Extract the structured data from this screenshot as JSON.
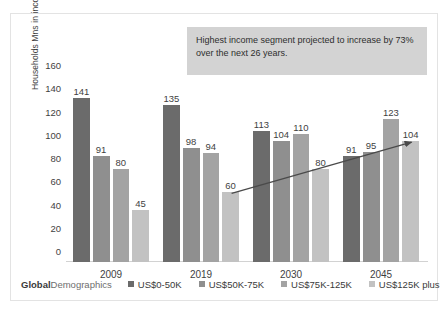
{
  "chart_data": {
    "type": "bar",
    "title": "",
    "xlabel": "",
    "ylabel": "Households Mns in income segment",
    "categories": [
      "2009",
      "2019",
      "2030",
      "2045"
    ],
    "ylim": [
      0,
      160
    ],
    "yticks": [
      0,
      20,
      40,
      60,
      80,
      100,
      120,
      140,
      160
    ],
    "grid": false,
    "legend_position": "bottom",
    "series": [
      {
        "name": "US$0-50K",
        "color": "#6b6b6b",
        "values": [
          141,
          135,
          113,
          91
        ]
      },
      {
        "name": "US$50K-75K",
        "color": "#8f8f8f",
        "values": [
          91,
          98,
          104,
          95
        ]
      },
      {
        "name": "US$75K-125K",
        "color": "#a3a3a3",
        "values": [
          80,
          94,
          110,
          123
        ]
      },
      {
        "name": "US$125K plus",
        "color": "#c2c2c2",
        "values": [
          45,
          60,
          80,
          104
        ]
      }
    ],
    "annotations": [
      {
        "name": "callout-box",
        "text": "Highest income segment projected to increase by 73% over the next 26 years."
      },
      {
        "name": "trend-arrow",
        "from_category": "2019",
        "from_series": "US$125K plus",
        "from_value": 60,
        "to_category": "2045",
        "to_series": "US$125K plus",
        "to_value": 104
      }
    ]
  },
  "brand": {
    "strong": "Global",
    "light": "Demographics"
  }
}
